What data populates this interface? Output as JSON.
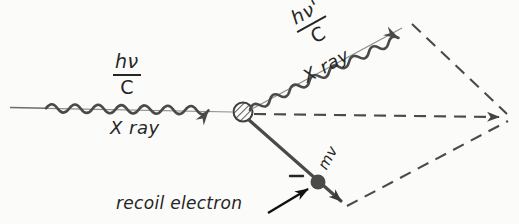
{
  "figure": {
    "background_color": "#fbfbf9",
    "ink_color": "#4a4a4a",
    "text_color": "#262626"
  },
  "labels": {
    "incident_photon": {
      "numerator": "hν",
      "denominator": "C"
    },
    "incident_xray": "X ray",
    "scattered_photon": {
      "numerator": "hν'",
      "denominator": "C"
    },
    "scattered_xray": "X ray",
    "electron_momentum": "mv",
    "electron_charge_sign": "−",
    "recoil_electron": "recoil electron"
  },
  "geometry": {
    "incident_ray_start": [
      10,
      107
    ],
    "scatter_vertex": [
      243,
      112
    ],
    "scattered_ray_tip": [
      409,
      23
    ],
    "electron_dot": [
      318,
      182
    ],
    "electron_arrow_tip": [
      345,
      205
    ],
    "resultant_apex": [
      508,
      117
    ]
  }
}
